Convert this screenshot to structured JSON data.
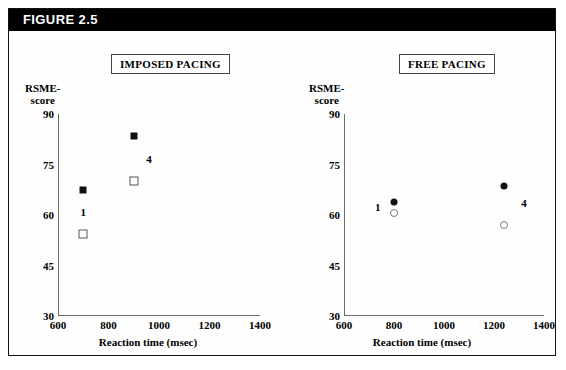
{
  "banner": {
    "label": "FIGURE 2.5"
  },
  "axis_titles": {
    "x": "Reaction time (msec)",
    "y_line1": "RSME-",
    "y_line2": "score"
  },
  "chart_data": [
    {
      "type": "scatter",
      "title": "IMPOSED PACING",
      "xlabel": "Reaction time (msec)",
      "ylabel": "RSME-score",
      "xlim": [
        600,
        1400
      ],
      "ylim": [
        30,
        90
      ],
      "xticks": [
        600,
        800,
        1000,
        1200,
        1400
      ],
      "yticks": [
        30,
        45,
        60,
        75,
        90
      ],
      "grid": false,
      "legend": "none",
      "series": [
        {
          "name": "filled-square",
          "marker": "square-filled",
          "points": [
            {
              "x": 700,
              "y": 67.5
            },
            {
              "x": 900,
              "y": 83.5
            }
          ]
        },
        {
          "name": "open-square",
          "marker": "square-open",
          "points": [
            {
              "x": 700,
              "y": 54.5
            },
            {
              "x": 900,
              "y": 70.0
            }
          ]
        }
      ],
      "annotations": [
        {
          "text": "1",
          "x": 700,
          "y": 61.0
        },
        {
          "text": "4",
          "x": 960,
          "y": 76.5
        }
      ]
    },
    {
      "type": "scatter",
      "title": "FREE PACING",
      "xlabel": "Reaction time (msec)",
      "ylabel": "RSME-score",
      "xlim": [
        600,
        1400
      ],
      "ylim": [
        30,
        90
      ],
      "xticks": [
        600,
        800,
        1000,
        1200,
        1400
      ],
      "yticks": [
        30,
        45,
        60,
        75,
        90
      ],
      "grid": false,
      "legend": "none",
      "series": [
        {
          "name": "filled-circle",
          "marker": "circle-filled",
          "points": [
            {
              "x": 800,
              "y": 64.0
            },
            {
              "x": 1240,
              "y": 68.5
            }
          ]
        },
        {
          "name": "open-circle",
          "marker": "circle-open",
          "points": [
            {
              "x": 800,
              "y": 60.5
            },
            {
              "x": 1240,
              "y": 57.0
            }
          ]
        }
      ],
      "annotations": [
        {
          "text": "1",
          "x": 735,
          "y": 62.5
        },
        {
          "text": "4",
          "x": 1320,
          "y": 63.5
        }
      ]
    }
  ]
}
